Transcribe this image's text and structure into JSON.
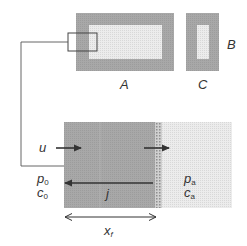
{
  "diagram": {
    "top": {
      "rect_A": {
        "label": "A"
      },
      "rect_C": {
        "label": "C"
      },
      "label_B": "B"
    },
    "bottom": {
      "flow_label": "u",
      "flux_label": "j",
      "left_region": {
        "pressure": "p",
        "pressure_sub": "0",
        "concentration": "c",
        "concentration_sub": "0"
      },
      "right_region": {
        "pressure": "p",
        "pressure_sub": "a",
        "concentration": "c",
        "concentration_sub": "a"
      },
      "length_label": "x",
      "length_sub": "f"
    },
    "colors": {
      "dark_region": "#a9a9a9",
      "light_region": "#e6e6e6",
      "stipple_band": "#bdbdbd",
      "line": "#333333",
      "text": "#333333"
    }
  }
}
